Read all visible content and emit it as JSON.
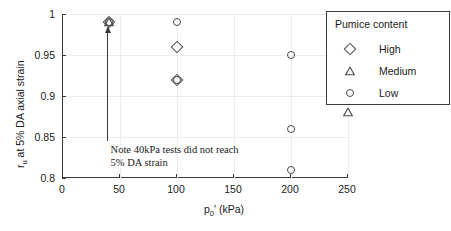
{
  "chart_data": {
    "type": "scatter",
    "title": "",
    "xlabel": "p0' (kPa)",
    "ylabel": "ru at 5% DA axial strain",
    "xlim": [
      0,
      250
    ],
    "ylim": [
      0.8,
      1.0
    ],
    "xticks": [
      0,
      50,
      100,
      150,
      200,
      250
    ],
    "yticks": [
      0.8,
      0.85,
      0.9,
      0.95,
      1
    ],
    "xtick_labels": [
      "0",
      "50",
      "100",
      "150",
      "200",
      "250"
    ],
    "ytick_labels": [
      "0.8",
      "0.85",
      "0.9",
      "0.95",
      "1"
    ],
    "grid": true,
    "legend_position": "top-right",
    "series": [
      {
        "name": "High",
        "marker": "diamond",
        "points": [
          {
            "x": 40,
            "y": 0.99
          },
          {
            "x": 100,
            "y": 0.96
          },
          {
            "x": 100,
            "y": 0.92
          }
        ]
      },
      {
        "name": "Medium",
        "marker": "triangle",
        "points": [
          {
            "x": 40,
            "y": 0.99
          },
          {
            "x": 250,
            "y": 0.88
          }
        ]
      },
      {
        "name": "Low",
        "marker": "circle",
        "points": [
          {
            "x": 40,
            "y": 0.99
          },
          {
            "x": 100,
            "y": 0.99
          },
          {
            "x": 100,
            "y": 0.92
          },
          {
            "x": 200,
            "y": 0.95
          },
          {
            "x": 200,
            "y": 0.86
          },
          {
            "x": 200,
            "y": 0.81
          }
        ]
      }
    ],
    "annotations": [
      {
        "text_line1": "Note 40kPa tests did not reach",
        "text_line2": "5% DA strain",
        "arrow_from": {
          "x": 40,
          "y": 0.845
        },
        "arrow_to": {
          "x": 40,
          "y": 0.985
        }
      }
    ]
  },
  "axis": {
    "x_label_main": "p",
    "x_label_sub": "0",
    "x_label_tail": "' (kPa)",
    "y_label_main": "r",
    "y_label_sub": "u",
    "y_label_tail": " at 5% DA axial strain"
  },
  "legend": {
    "title": "Pumice content",
    "items": [
      {
        "label": "High",
        "marker": "diamond"
      },
      {
        "label": "Medium",
        "marker": "triangle"
      },
      {
        "label": "Low",
        "marker": "circle"
      }
    ]
  },
  "note": {
    "line1": "Note 40kPa tests did not reach",
    "line2": "5% DA strain"
  },
  "colors": {
    "axis": "#3a3a3a",
    "grid": "#ededed",
    "marker": "#4a4a4a",
    "text": "#1a1a1a",
    "background": "#ffffff"
  }
}
